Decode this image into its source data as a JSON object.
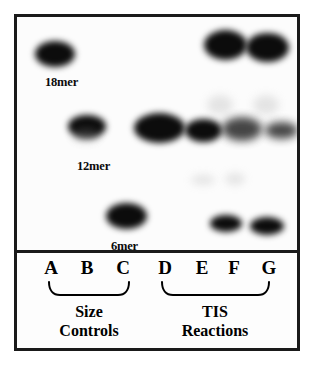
{
  "figure": {
    "type": "gel-electrophoresis-autoradiograph",
    "panels": [
      "gel",
      "lane-legend"
    ]
  },
  "gel": {
    "size_markers": [
      {
        "label": "18mer",
        "lane": "A",
        "label_x": 28,
        "label_y": 58
      },
      {
        "label": "12mer",
        "lane": "B",
        "label_x": 60,
        "label_y": 142
      },
      {
        "label": "6mer",
        "lane": "C",
        "label_x": 94,
        "label_y": 222
      }
    ],
    "rows": [
      {
        "name": "18mer",
        "y": 24
      },
      {
        "name": "12mer",
        "y": 106
      },
      {
        "name": "6mer",
        "y": 192
      }
    ],
    "bands": [
      {
        "lane": "A",
        "row": "18mer",
        "x": 18,
        "y": 24,
        "w": 40,
        "h": 26,
        "intensity": "strong",
        "blur": "soft"
      },
      {
        "lane": "F",
        "row": "18mer",
        "x": 187,
        "y": 13,
        "w": 43,
        "h": 30,
        "intensity": "strong",
        "blur": "soft"
      },
      {
        "lane": "G",
        "row": "18mer",
        "x": 229,
        "y": 16,
        "w": 43,
        "h": 29,
        "intensity": "strong",
        "blur": "soft"
      },
      {
        "lane": "B",
        "row": "12mer",
        "x": 51,
        "y": 98,
        "w": 38,
        "h": 23,
        "intensity": "strong",
        "blur": "soft"
      },
      {
        "lane": "B",
        "row": "12mer",
        "x": 56,
        "y": 112,
        "w": 26,
        "h": 12,
        "intensity": "faint",
        "blur": "faint"
      },
      {
        "lane": "D",
        "row": "12mer",
        "x": 117,
        "y": 96,
        "w": 51,
        "h": 30,
        "intensity": "strong",
        "blur": "soft"
      },
      {
        "lane": "E",
        "row": "12mer",
        "x": 168,
        "y": 102,
        "w": 37,
        "h": 23,
        "intensity": "strong",
        "blur": "soft"
      },
      {
        "lane": "F",
        "row": "12mer",
        "x": 205,
        "y": 100,
        "w": 40,
        "h": 24,
        "intensity": "medium",
        "blur": "softer"
      },
      {
        "lane": "G",
        "row": "12mer",
        "x": 248,
        "y": 105,
        "w": 33,
        "h": 17,
        "intensity": "medium",
        "blur": "softer"
      },
      {
        "lane": "F",
        "row": "smear",
        "x": 190,
        "y": 78,
        "w": 26,
        "h": 20,
        "intensity": "trace",
        "blur": "faint"
      },
      {
        "lane": "G",
        "row": "smear",
        "x": 236,
        "y": 78,
        "w": 26,
        "h": 20,
        "intensity": "trace",
        "blur": "faint"
      },
      {
        "lane": "F",
        "row": "smear2",
        "x": 174,
        "y": 158,
        "w": 24,
        "h": 10,
        "intensity": "trace",
        "blur": "faint"
      },
      {
        "lane": "G",
        "row": "smear2",
        "x": 208,
        "y": 156,
        "w": 20,
        "h": 12,
        "intensity": "trace",
        "blur": "faint"
      },
      {
        "lane": "C",
        "row": "6mer",
        "x": 89,
        "y": 186,
        "w": 41,
        "h": 26,
        "intensity": "strong",
        "blur": "soft"
      },
      {
        "lane": "F",
        "row": "6mer",
        "x": 193,
        "y": 198,
        "w": 32,
        "h": 17,
        "intensity": "strong",
        "blur": "soft"
      },
      {
        "lane": "G",
        "row": "6mer",
        "x": 233,
        "y": 200,
        "w": 34,
        "h": 18,
        "intensity": "strong",
        "blur": "soft"
      }
    ]
  },
  "legend": {
    "lanes": [
      {
        "letter": "A",
        "x": 34
      },
      {
        "letter": "B",
        "x": 70
      },
      {
        "letter": "C",
        "x": 106
      },
      {
        "letter": "D",
        "x": 148
      },
      {
        "letter": "E",
        "x": 185
      },
      {
        "letter": "F",
        "x": 217
      },
      {
        "letter": "G",
        "x": 252
      }
    ],
    "groups": [
      {
        "id": "size-controls",
        "line1": "Size",
        "line2": "Controls",
        "bracket_left": 32,
        "bracket_right": 112,
        "label_center": 72
      },
      {
        "id": "tis-reactions",
        "line1": "TIS",
        "line2": "Reactions",
        "bracket_left": 145,
        "bracket_right": 252,
        "label_center": 198
      }
    ]
  },
  "colors": {
    "frame": "#1a1a1a",
    "background": "#ffffff",
    "panel": "#fdfdfd",
    "band": "#101010",
    "text": "#000000"
  }
}
